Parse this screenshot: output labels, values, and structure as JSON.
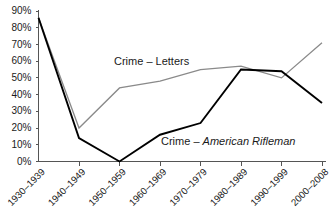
{
  "chart_data": {
    "type": "line",
    "title": "",
    "xlabel": "",
    "ylabel": "",
    "categories": [
      "1930–1939",
      "1940–1949",
      "1950–1959",
      "1960–1969",
      "1970–1979",
      "1980–1989",
      "1990–1999",
      "2000–2008"
    ],
    "ylim": [
      0,
      90
    ],
    "ytick_labels": [
      "0%",
      "10%",
      "20%",
      "30%",
      "40%",
      "50%",
      "60%",
      "70%",
      "80%",
      "90%"
    ],
    "ytick_values": [
      0,
      10,
      20,
      30,
      40,
      50,
      60,
      70,
      80,
      90
    ],
    "grid": false,
    "legend_position": "inline-annotation",
    "series": [
      {
        "name": "Crime – Letters",
        "color": "#8a8a8a",
        "values": [
          86,
          20,
          44,
          48,
          55,
          57,
          50,
          71
        ]
      },
      {
        "name": "Crime – American Rifleman",
        "color": "#000000",
        "values": [
          86,
          14,
          0,
          16,
          23,
          55,
          54,
          35
        ]
      }
    ],
    "annotations": [
      {
        "name": "letters-label",
        "text_plain": "Crime – Letters",
        "text_prefix": "Crime – ",
        "text_italic": "Letters",
        "italic": false,
        "x": 114,
        "y": 65
      },
      {
        "name": "american-rifleman-label",
        "text_plain": "Crime – American Rifleman",
        "text_prefix": "Crime – ",
        "text_italic": "American Rifleman",
        "italic": true,
        "x": 161,
        "y": 145
      }
    ]
  },
  "axes": {
    "y_axis_color": "#555555",
    "x_axis_color": "#555555"
  }
}
